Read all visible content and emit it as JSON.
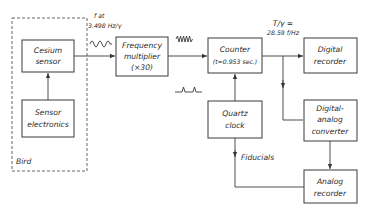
{
  "diagram": {
    "group": {
      "label": "Bird"
    },
    "blocks": {
      "cesium_sensor": {
        "line1": "Cesium",
        "line2": "sensor"
      },
      "sensor_electronics": {
        "line1": "Sensor",
        "line2": "electronics"
      },
      "frequency_multiplier": {
        "line1": "Frequency",
        "line2": "multiplier",
        "line3": "(×30)"
      },
      "counter": {
        "line1": "Counter",
        "line2": "(t=0.953 sec.)"
      },
      "digital_recorder": {
        "line1": "Digital",
        "line2": "recorder"
      },
      "quartz_clock": {
        "line1": "Quartz",
        "line2": "clock"
      },
      "digital_analog_converter": {
        "line1": "Digital-",
        "line2": "analog",
        "line3": "converter"
      },
      "analog_recorder": {
        "line1": "Analog",
        "line2": "recorder"
      }
    },
    "annotations": {
      "sensor_signal_line1": "f at",
      "sensor_signal_line2": "3.498 Hz/γ",
      "counter_output_line1": "T/γ =",
      "counter_output_line2": "28.59 f/Hz",
      "fiducials": "Fiducials"
    },
    "edges": [
      {
        "from": "Sensor electronics",
        "to": "Cesium sensor"
      },
      {
        "from": "Cesium sensor",
        "to": "Frequency multiplier"
      },
      {
        "from": "Frequency multiplier",
        "to": "Counter"
      },
      {
        "from": "Quartz clock",
        "to": "Counter"
      },
      {
        "from": "Counter",
        "to": "Digital recorder"
      },
      {
        "from": "Counter",
        "to": "Digital-analog converter"
      },
      {
        "from": "Digital-analog converter",
        "to": "Analog recorder"
      },
      {
        "from": "Quartz clock",
        "to": "Analog recorder",
        "label": "Fiducials"
      }
    ]
  }
}
